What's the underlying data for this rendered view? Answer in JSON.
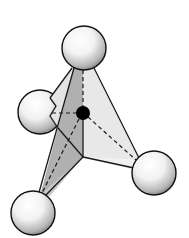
{
  "diagram": {
    "title": "Tetrahedral molecular geometry",
    "central_atom": {
      "x": 83,
      "y": 113,
      "r": 7,
      "color": "#000000"
    },
    "ligands": [
      {
        "name": "top",
        "x": 84,
        "y": 48,
        "r": 22
      },
      {
        "name": "left",
        "x": 40,
        "y": 112,
        "r": 22
      },
      {
        "name": "right",
        "x": 154,
        "y": 173,
        "r": 22
      },
      {
        "name": "bottom-left",
        "x": 33,
        "y": 213,
        "r": 22
      }
    ],
    "colors": {
      "face_light": "#e6e6e6",
      "face_mid": "#c8c8c8",
      "face_dark": "#a9a9a9",
      "edge": "#222222",
      "sphere_fill": "#f4f4f4",
      "sphere_shade": "#7a7a7a"
    }
  }
}
